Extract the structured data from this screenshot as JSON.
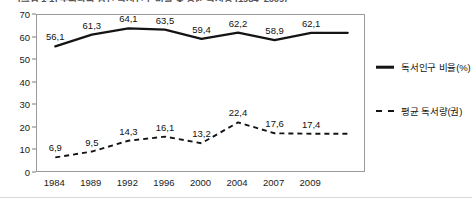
{
  "chart_data": {
    "type": "line",
    "title": "[그림 1-1] 우리나라 성인 독서인구 비율 및 평균 독서량 (1984~2009)",
    "title_visible_note": "title is cropped at the top edge of the screenshot and is largely illegible",
    "subtitle": "",
    "xlabel": "",
    "ylabel": "",
    "ylim": [
      0,
      70
    ],
    "yticks": [
      0,
      10,
      20,
      30,
      40,
      50,
      60,
      70
    ],
    "ytick_labels": [
      "0",
      "10",
      "20",
      "30",
      "40",
      "50",
      "60",
      "70"
    ],
    "grid": false,
    "legend_position": "right",
    "decimal_separator": ",",
    "categories": [
      "1984",
      "1989",
      "1992",
      "1996",
      "2000",
      "2004",
      "2007",
      "2009",
      ""
    ],
    "xtick_labels": [
      "1984",
      "1989",
      "1992",
      "1996",
      "2000",
      "2004",
      "2007",
      "2009"
    ],
    "series": [
      {
        "name": "독서인구 비율(%)",
        "style": "solid",
        "color": "#141414",
        "values": [
          56.1,
          61.3,
          64.1,
          63.5,
          59.4,
          62.2,
          58.9,
          62.1,
          62.1
        ],
        "point_labels": [
          "56,1",
          "61,3",
          "64,1",
          "63,5",
          "59,4",
          "62,2",
          "58,9",
          "62,1",
          ""
        ]
      },
      {
        "name": "평균 독서량(권)",
        "style": "dashed",
        "color": "#141414",
        "values": [
          6.9,
          9.5,
          14.3,
          16.1,
          13.2,
          22.4,
          17.6,
          17.4,
          17.4
        ],
        "point_labels": [
          "6,9",
          "9,5",
          "14,3",
          "16,1",
          "13,2",
          "22,4",
          "17,6",
          "17,4",
          ""
        ]
      }
    ]
  },
  "legend": {
    "items": [
      {
        "label": "독서인구 비율(%)",
        "style": "solid"
      },
      {
        "label": "평균 독서량(권)",
        "style": "dashed"
      }
    ]
  }
}
